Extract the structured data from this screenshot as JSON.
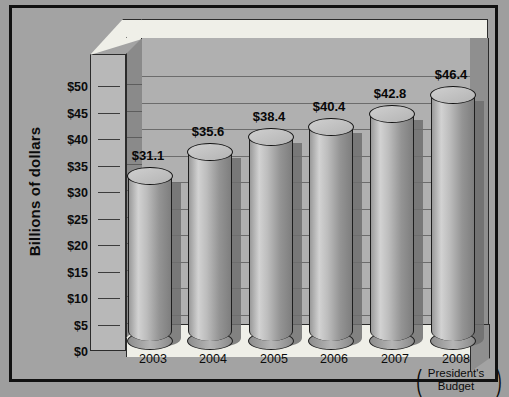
{
  "chart_data": {
    "type": "bar",
    "title": "",
    "xlabel": "",
    "ylabel": "Billions of dollars",
    "categories": [
      "2003",
      "2004",
      "2005",
      "2006",
      "2007",
      "2008"
    ],
    "category_sublabels": [
      "",
      "",
      "",
      "",
      "",
      "(President's Budget)"
    ],
    "values": [
      31.1,
      35.6,
      38.4,
      40.4,
      42.8,
      46.4
    ],
    "data_labels": [
      "$31.1",
      "$35.6",
      "$38.4",
      "$40.4",
      "$42.8",
      "$46.4"
    ],
    "ylim": [
      0,
      50
    ],
    "ytick_values": [
      0,
      5,
      10,
      15,
      20,
      25,
      30,
      35,
      40,
      45,
      50
    ],
    "ytick_labels": [
      "$0",
      "$5",
      "$10",
      "$15",
      "$20",
      "$25",
      "$30",
      "$35",
      "$40",
      "$45",
      "$50"
    ],
    "grid": true,
    "legend": "none",
    "style_3d": true,
    "bar_shape": "cylinder",
    "colors": {
      "background": "#9e9e9e",
      "panel": "#a3a3a3",
      "wall": "#b0b0b0",
      "floor": "#efefe8",
      "bar": "#b0b0b0",
      "bar_outline": "#151515",
      "gridline": "#6c6c6c",
      "text": "#0b0b0b"
    }
  },
  "axis": {
    "y_title": "Billions of dollars"
  },
  "president_budget": {
    "open_paren": "(",
    "close_paren": ")",
    "line1": "President's",
    "line2": "Budget"
  }
}
